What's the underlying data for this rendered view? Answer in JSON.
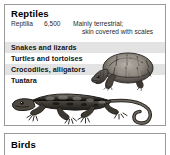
{
  "reptiles_card": {
    "title": "Reptiles",
    "scientific_name": "Reptilia",
    "species_count": "6,500",
    "description_line1": "Mainly terrestrial;",
    "description_line2": "skin covered with scales",
    "groups": [
      {
        "label": "Snakes and lizards",
        "shaded": true
      },
      {
        "label": "Turtles and tortoises",
        "shaded": false
      },
      {
        "label": "Crocodiles, alligators",
        "shaded": true
      },
      {
        "label": "Tuatara",
        "shaded": false
      }
    ],
    "illustrations": [
      {
        "name": "tortoise-illustration"
      },
      {
        "name": "lizard-illustration"
      }
    ]
  },
  "birds_card": {
    "title": "Birds"
  },
  "colors": {
    "band_shaded": "#e3e3e3",
    "band_plain": "#ffffff",
    "border": "#9a9a9a",
    "text": "#141414",
    "background": "#ffffff"
  }
}
